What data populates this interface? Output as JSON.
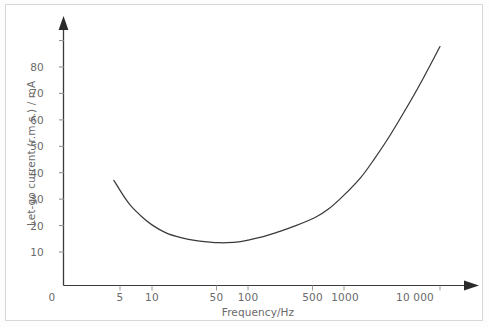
{
  "chart_data": {
    "type": "line",
    "title": "",
    "xlabel": "Frequency/Hz",
    "ylabel": "Let-go current (r.m.s.) / mA",
    "xscale": "log",
    "yscale": "linear",
    "grid": false,
    "legend": null,
    "xlim": [
      4,
      14000
    ],
    "ylim": [
      0,
      85
    ],
    "xticks": [
      {
        "label": "0",
        "value": 0
      },
      {
        "label": "5",
        "value": 5
      },
      {
        "label": "10",
        "value": 10
      },
      {
        "label": "50",
        "value": 50
      },
      {
        "label": "100",
        "value": 100
      },
      {
        "label": "500",
        "value": 500
      },
      {
        "label": "1000",
        "value": 1000
      },
      {
        "label": "10 000",
        "value": 10000
      }
    ],
    "yticks": [
      {
        "label": "10",
        "value": 10
      },
      {
        "label": "20",
        "value": 20
      },
      {
        "label": "30",
        "value": 30
      },
      {
        "label": "40",
        "value": 40
      },
      {
        "label": "50",
        "value": 50
      },
      {
        "label": "60",
        "value": 60
      },
      {
        "label": "70",
        "value": 70
      },
      {
        "label": "80",
        "value": 80
      }
    ],
    "series": [
      {
        "name": "Let-go current",
        "color": "#3a3a3a",
        "x": [
          4,
          5,
          6,
          8,
          10,
          14,
          20,
          30,
          40,
          50,
          60,
          80,
          100,
          150,
          200,
          300,
          500,
          700,
          1000,
          1500,
          2000,
          3000,
          5000,
          7000,
          10000
        ],
        "y": [
          33.0,
          28.0,
          24.5,
          20.5,
          18.0,
          15.3,
          13.7,
          12.6,
          12.2,
          12.0,
          12.0,
          12.3,
          12.9,
          14.2,
          15.5,
          17.5,
          20.5,
          23.5,
          28.0,
          34.0,
          39.5,
          48.0,
          60.0,
          68.5,
          78.0
        ]
      }
    ],
    "annotations": []
  },
  "axes": {
    "y_arrow": "up-arrow",
    "x_arrow": "right-arrow"
  }
}
